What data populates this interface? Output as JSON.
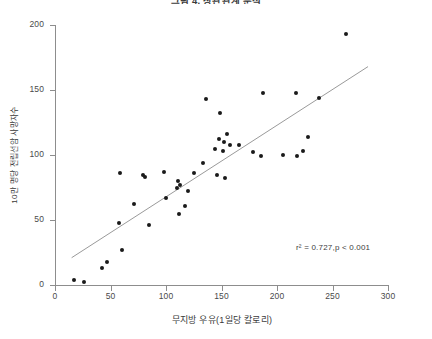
{
  "chart_data": {
    "type": "scatter",
    "title": "그림 4. 상관관계 분석",
    "xlabel": "무지방 우유(1일당 칼로리)",
    "ylabel": "10만 명당 전립선암 사망자수",
    "xlim": [
      0,
      300
    ],
    "ylim": [
      0,
      200
    ],
    "xticks": [
      0,
      50,
      100,
      150,
      200,
      250,
      300
    ],
    "yticks": [
      0,
      50,
      100,
      150,
      200
    ],
    "grid": false,
    "legend": null,
    "annotation": "r² = 0.727,p < 0.001",
    "r_squared": 0.727,
    "p_value": "< 0.001",
    "fit_line": {
      "x": [
        15,
        282
      ],
      "y": [
        21,
        168
      ]
    },
    "points": [
      {
        "x": 17,
        "y": 4
      },
      {
        "x": 26,
        "y": 2
      },
      {
        "x": 47,
        "y": 18
      },
      {
        "x": 42,
        "y": 13
      },
      {
        "x": 60,
        "y": 27
      },
      {
        "x": 85,
        "y": 46
      },
      {
        "x": 58,
        "y": 48
      },
      {
        "x": 71,
        "y": 62
      },
      {
        "x": 100,
        "y": 67
      },
      {
        "x": 117,
        "y": 61
      },
      {
        "x": 120,
        "y": 72
      },
      {
        "x": 112,
        "y": 55
      },
      {
        "x": 110,
        "y": 75
      },
      {
        "x": 113,
        "y": 77
      },
      {
        "x": 111,
        "y": 80
      },
      {
        "x": 59,
        "y": 86
      },
      {
        "x": 79,
        "y": 85
      },
      {
        "x": 81,
        "y": 83
      },
      {
        "x": 98,
        "y": 87
      },
      {
        "x": 125,
        "y": 86
      },
      {
        "x": 146,
        "y": 85
      },
      {
        "x": 153,
        "y": 82
      },
      {
        "x": 133,
        "y": 94
      },
      {
        "x": 144,
        "y": 105
      },
      {
        "x": 148,
        "y": 112
      },
      {
        "x": 152,
        "y": 110
      },
      {
        "x": 155,
        "y": 116
      },
      {
        "x": 151,
        "y": 103
      },
      {
        "x": 158,
        "y": 108
      },
      {
        "x": 166,
        "y": 108
      },
      {
        "x": 178,
        "y": 102
      },
      {
        "x": 186,
        "y": 99
      },
      {
        "x": 205,
        "y": 100
      },
      {
        "x": 223,
        "y": 103
      },
      {
        "x": 228,
        "y": 114
      },
      {
        "x": 218,
        "y": 99
      },
      {
        "x": 136,
        "y": 143
      },
      {
        "x": 149,
        "y": 132
      },
      {
        "x": 187,
        "y": 148
      },
      {
        "x": 217,
        "y": 148
      },
      {
        "x": 238,
        "y": 144
      },
      {
        "x": 262,
        "y": 193
      }
    ]
  }
}
